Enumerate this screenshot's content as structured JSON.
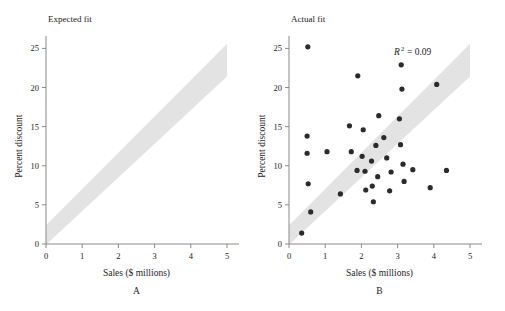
{
  "figure": {
    "background_color": "#ffffff",
    "axis_color": "#8a8a8a",
    "text_color": "#1c1c1c",
    "band_color": "#e3e3e3",
    "point_color": "#2b2b2b"
  },
  "chart_data": [
    {
      "type": "area",
      "title": "Expected fit",
      "panel_letter": "A",
      "xlabel": "Sales ($ millions)",
      "ylabel": "Percent discount",
      "xlim": [
        0,
        5
      ],
      "ylim": [
        0,
        26.5
      ],
      "xticks": [
        0,
        1,
        2,
        3,
        4,
        5
      ],
      "xtick_labels": [
        "0",
        "1",
        "2",
        "3",
        "4",
        "5"
      ],
      "yticks": [
        0,
        5,
        10,
        15,
        20,
        25
      ],
      "ytick_labels": [
        "0",
        "5",
        "10",
        "15",
        "20",
        "25"
      ],
      "grid": false,
      "legend": "none",
      "band": {
        "label": "expected-fit-band",
        "slope": 4.36,
        "upper_intercept": 2.4,
        "lower_intercept": -0.1,
        "x_start": 0.0,
        "x_end": 5.0,
        "upper_at_x_start": 2.4,
        "upper_at_x_end": 25.6,
        "lower_at_x_start": -0.1,
        "lower_at_x_end": 21.4,
        "color": "#e3e3e3"
      },
      "points": []
    },
    {
      "type": "scatter",
      "title": "Actual fit",
      "panel_letter": "B",
      "xlabel": "Sales ($ millions)",
      "ylabel": "Percent discount",
      "xlim": [
        0,
        5
      ],
      "ylim": [
        0,
        26.5
      ],
      "xticks": [
        0,
        1,
        2,
        3,
        4,
        5
      ],
      "xtick_labels": [
        "0",
        "1",
        "2",
        "3",
        "4",
        "5"
      ],
      "yticks": [
        0,
        5,
        10,
        15,
        20,
        25
      ],
      "ytick_labels": [
        "0",
        "5",
        "10",
        "15",
        "20",
        "25"
      ],
      "grid": false,
      "legend": "none",
      "annotations": [
        {
          "name": "r-squared",
          "symbol": "R",
          "superscript": "2",
          "equals": "=",
          "value": "0.09",
          "text": "R2 = 0.09",
          "x": 2.9,
          "y": 24.2
        }
      ],
      "band": {
        "label": "actual-fit-band",
        "slope": 4.36,
        "upper_intercept": 2.4,
        "lower_intercept": -0.1,
        "x_start": 0.0,
        "x_end": 5.0,
        "upper_at_x_start": 2.4,
        "upper_at_x_end": 25.6,
        "lower_at_x_start": -0.1,
        "lower_at_x_end": 21.4,
        "color": "#e3e3e3"
      },
      "point_radius": 2.6,
      "point_color": "#2b2b2b",
      "points": [
        {
          "x": 0.35,
          "y": 1.4
        },
        {
          "x": 0.52,
          "y": 25.2
        },
        {
          "x": 0.5,
          "y": 13.8
        },
        {
          "x": 0.5,
          "y": 11.6
        },
        {
          "x": 0.53,
          "y": 7.7
        },
        {
          "x": 0.6,
          "y": 4.1
        },
        {
          "x": 1.05,
          "y": 11.8
        },
        {
          "x": 1.42,
          "y": 6.4
        },
        {
          "x": 1.67,
          "y": 15.1
        },
        {
          "x": 1.72,
          "y": 11.8
        },
        {
          "x": 1.88,
          "y": 9.4
        },
        {
          "x": 1.9,
          "y": 21.5
        },
        {
          "x": 2.02,
          "y": 11.2
        },
        {
          "x": 2.05,
          "y": 14.6
        },
        {
          "x": 2.1,
          "y": 9.3
        },
        {
          "x": 2.12,
          "y": 6.9
        },
        {
          "x": 2.28,
          "y": 10.6
        },
        {
          "x": 2.3,
          "y": 7.4
        },
        {
          "x": 2.33,
          "y": 5.4
        },
        {
          "x": 2.4,
          "y": 12.6
        },
        {
          "x": 2.45,
          "y": 8.6
        },
        {
          "x": 2.48,
          "y": 16.4
        },
        {
          "x": 2.62,
          "y": 13.6
        },
        {
          "x": 2.7,
          "y": 11.0
        },
        {
          "x": 2.78,
          "y": 6.8
        },
        {
          "x": 2.82,
          "y": 9.2
        },
        {
          "x": 3.05,
          "y": 16.0
        },
        {
          "x": 3.08,
          "y": 12.7
        },
        {
          "x": 3.1,
          "y": 22.9
        },
        {
          "x": 3.12,
          "y": 19.8
        },
        {
          "x": 3.15,
          "y": 10.2
        },
        {
          "x": 3.18,
          "y": 8.0
        },
        {
          "x": 3.42,
          "y": 9.5
        },
        {
          "x": 3.9,
          "y": 7.2
        },
        {
          "x": 4.08,
          "y": 20.4
        },
        {
          "x": 4.35,
          "y": 9.4
        }
      ]
    }
  ]
}
